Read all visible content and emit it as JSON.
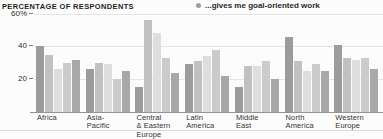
{
  "header": {
    "title": "PERCENTAGE OF RESPONDENTS"
  },
  "legend": {
    "label": "...gives me goal-oriented work",
    "marker_color": "#9e9e9e"
  },
  "chart_data": {
    "type": "bar",
    "grouped": true,
    "title": "PERCENTAGE OF RESPONDENTS",
    "xlabel": "",
    "ylabel": "PERCENTAGE OF RESPONDENTS",
    "ylim": [
      0,
      60
    ],
    "grid": true,
    "legend_position": "top-center",
    "legend_entries": [
      "...gives me goal-oriented work"
    ],
    "yticks": [
      {
        "label": "60%",
        "value": 60
      },
      {
        "label": "40",
        "value": 40
      },
      {
        "label": "20",
        "value": 20
      }
    ],
    "categories": [
      "Africa",
      "Asia-\nPacific",
      "Central\n& Eastern\nEurope",
      "Latin\nAmerica",
      "Middle\nEast",
      "North\nAmerica",
      "Western\nEurope"
    ],
    "series": [
      {
        "name": "series-1",
        "color": "#9c9c9c",
        "values": [
          40,
          26,
          15,
          29,
          15,
          46,
          41
        ]
      },
      {
        "name": "series-2",
        "color": "#c1c1c1",
        "values": [
          35,
          30,
          56,
          31,
          28,
          31,
          33
        ]
      },
      {
        "name": "series-3",
        "color": "#dedede",
        "values": [
          26,
          29,
          48,
          34,
          28,
          25,
          32
        ]
      },
      {
        "name": "series-4",
        "color": "#cbcbcb",
        "values": [
          30,
          20,
          33,
          38,
          31,
          29,
          33
        ]
      },
      {
        "name": "series-5",
        "color": "#a8a8a8",
        "values": [
          32,
          25,
          24,
          22,
          20,
          25,
          26
        ]
      }
    ]
  }
}
